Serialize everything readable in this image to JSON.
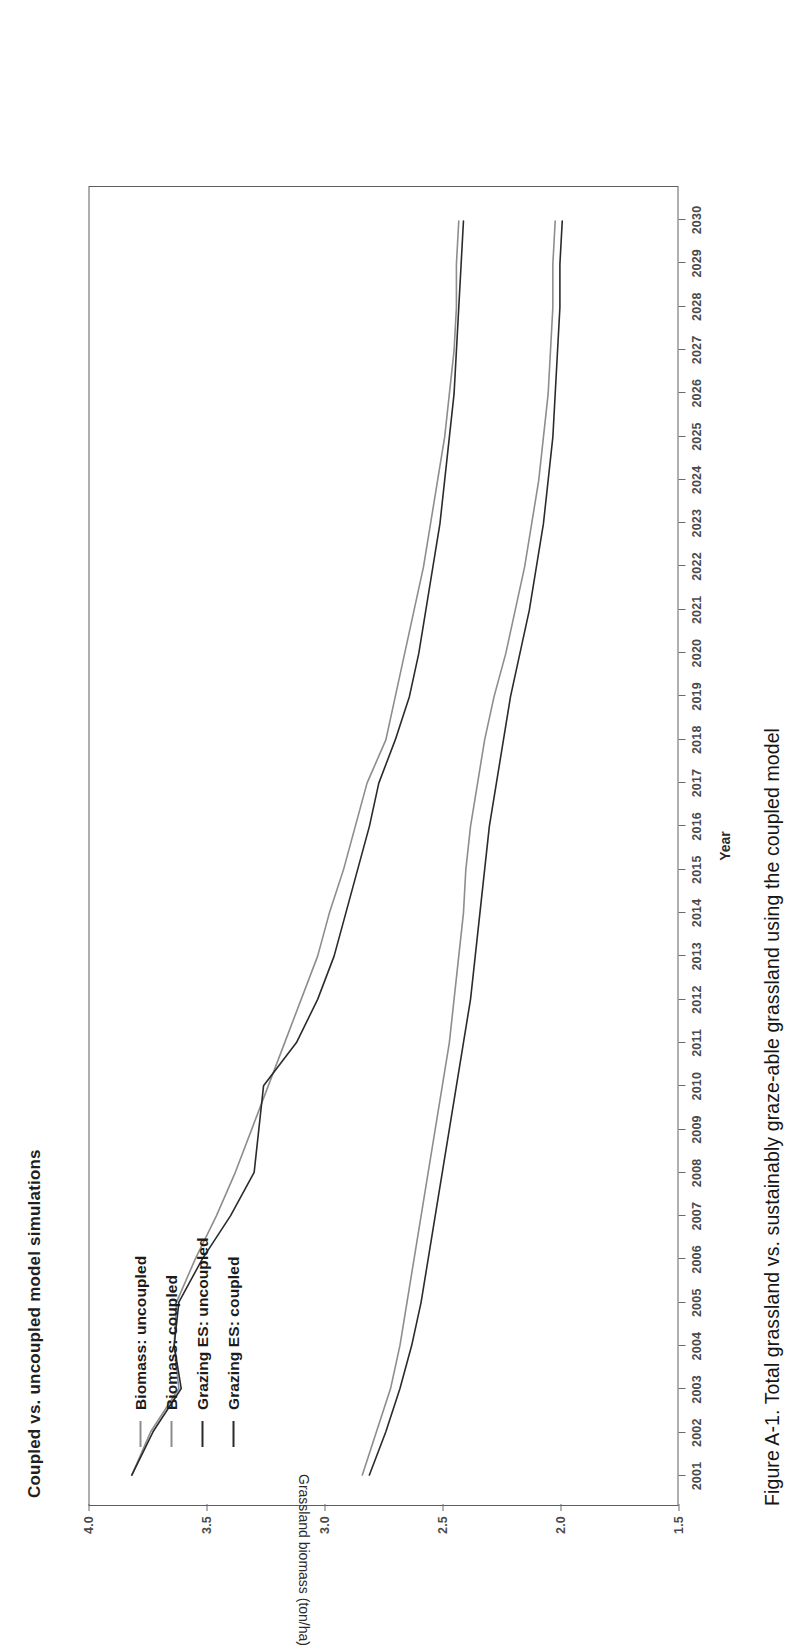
{
  "figure": {
    "title": "Coupled vs. uncoupled model simulations",
    "caption": "Figure A-1. Total grassland vs. sustainably graze-able grassland using the coupled model"
  },
  "legend": {
    "position": "top-left-inside",
    "items": [
      {
        "label": "Biomass: uncoupled",
        "color": "#8d8d8d"
      },
      {
        "label": "Biomass: coupled",
        "color": "#8d8d8d"
      },
      {
        "label": "Grazing ES: uncoupled",
        "color": "#2b2b2b"
      },
      {
        "label": "Grazing ES: coupled",
        "color": "#2b2b2b"
      }
    ]
  },
  "axes": {
    "x": {
      "title": "Year",
      "ticks": [
        "2001",
        "2002",
        "2003",
        "2004",
        "2005",
        "2006",
        "2007",
        "2008",
        "2009",
        "2010",
        "2011",
        "2012",
        "2013",
        "2014",
        "2015",
        "2016",
        "2017",
        "2018",
        "2019",
        "2020",
        "2021",
        "2022",
        "2023",
        "2024",
        "2025",
        "2026",
        "2027",
        "2028",
        "2029",
        "2030"
      ]
    },
    "y": {
      "title": "Grassland biomass (ton/ha)",
      "ticks": [
        "4.0",
        "3.5",
        "3.0",
        "2.5",
        "2.0",
        "1.5"
      ]
    }
  },
  "chart_data": {
    "type": "line",
    "title": "Coupled vs. uncoupled model simulations",
    "xlabel": "Year",
    "ylabel": "Grassland biomass (ton/ha)",
    "xlim": [
      2001,
      2030
    ],
    "ylim": [
      1.5,
      4.0
    ],
    "grid": false,
    "legend_position": "top-left-inside",
    "x": [
      2001,
      2002,
      2003,
      2004,
      2005,
      2006,
      2007,
      2008,
      2009,
      2010,
      2011,
      2012,
      2013,
      2014,
      2015,
      2016,
      2017,
      2018,
      2019,
      2020,
      2021,
      2022,
      2023,
      2024,
      2025,
      2026,
      2027,
      2028,
      2029,
      2030
    ],
    "series": [
      {
        "name": "Biomass: uncoupled",
        "color": "#8d8d8d",
        "values": [
          3.82,
          3.74,
          3.62,
          3.64,
          3.63,
          3.55,
          3.46,
          3.38,
          3.31,
          3.24,
          3.17,
          3.1,
          3.03,
          2.98,
          2.92,
          2.87,
          2.82,
          2.74,
          2.7,
          2.66,
          2.62,
          2.58,
          2.55,
          2.52,
          2.49,
          2.47,
          2.45,
          2.44,
          2.44,
          2.43
        ]
      },
      {
        "name": "Biomass: coupled",
        "color": "#2b2b2b",
        "values": [
          3.82,
          3.73,
          3.61,
          3.64,
          3.62,
          3.52,
          3.4,
          3.3,
          3.28,
          3.26,
          3.12,
          3.03,
          2.96,
          2.91,
          2.86,
          2.81,
          2.77,
          2.7,
          2.64,
          2.6,
          2.57,
          2.54,
          2.51,
          2.49,
          2.47,
          2.45,
          2.44,
          2.43,
          2.42,
          2.41
        ]
      },
      {
        "name": "Grazing ES: uncoupled",
        "color": "#8d8d8d",
        "values": [
          2.84,
          2.78,
          2.72,
          2.68,
          2.65,
          2.62,
          2.59,
          2.56,
          2.53,
          2.5,
          2.47,
          2.45,
          2.43,
          2.41,
          2.4,
          2.38,
          2.35,
          2.32,
          2.28,
          2.23,
          2.19,
          2.15,
          2.12,
          2.09,
          2.07,
          2.05,
          2.04,
          2.03,
          2.03,
          2.02
        ]
      },
      {
        "name": "Grazing ES: coupled",
        "color": "#2b2b2b",
        "values": [
          2.81,
          2.74,
          2.68,
          2.63,
          2.59,
          2.56,
          2.53,
          2.5,
          2.47,
          2.44,
          2.41,
          2.38,
          2.36,
          2.34,
          2.32,
          2.3,
          2.27,
          2.24,
          2.21,
          2.17,
          2.13,
          2.1,
          2.07,
          2.05,
          2.03,
          2.02,
          2.01,
          2.0,
          2.0,
          1.99
        ]
      }
    ]
  }
}
